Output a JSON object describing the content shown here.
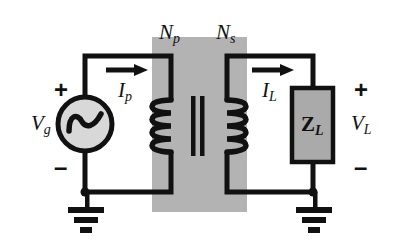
{
  "figure": {
    "kind": "transformer-circuit-schematic",
    "background_color": "#ffffff",
    "line_color": "#111111",
    "core_fill_color": "#b3b3b3",
    "load_fill_color": "#aaaaaa",
    "source_fill_color": "#d8d8d8"
  },
  "labels": {
    "primary_turns": "N",
    "primary_turns_sub": "p",
    "secondary_turns": "N",
    "secondary_turns_sub": "s",
    "primary_current": "I",
    "primary_current_sub": "p",
    "load_current": "I",
    "load_current_sub": "L",
    "source_voltage": "V",
    "source_voltage_sub": "g",
    "load_voltage": "V",
    "load_voltage_sub": "L",
    "load_impedance": "Z",
    "load_impedance_sub": "L",
    "source_plus": "+",
    "source_minus": "–",
    "load_plus": "+",
    "load_minus": "–"
  },
  "components": {
    "source": {
      "name": "ac-voltage-source",
      "symbol": "sine-wave-in-circle",
      "center_x": 85,
      "center_y": 124,
      "radius": 27
    },
    "load": {
      "name": "load-impedance-block",
      "x": 292,
      "y": 88,
      "width": 41,
      "height": 74
    },
    "core": {
      "name": "transformer-core-region",
      "x": 152,
      "y": 37,
      "width": 95,
      "height": 175
    },
    "primary_coil": {
      "name": "primary-winding",
      "turns_drawn": 4,
      "x": 171,
      "bulge": "left"
    },
    "secondary_coil": {
      "name": "secondary-winding",
      "turns_drawn": 4,
      "x": 227,
      "bulge": "right"
    },
    "core_bars": {
      "name": "core-laminations",
      "count": 2,
      "x1": 193,
      "x2": 202,
      "top": 96,
      "bottom": 155
    },
    "ground_left": {
      "name": "ground-symbol-primary",
      "x": 85,
      "y": 192
    },
    "ground_right": {
      "name": "ground-symbol-secondary",
      "x": 313,
      "y": 192
    }
  },
  "arrows": {
    "primary_current_arrow": {
      "x1": 106,
      "x2": 147,
      "y": 70
    },
    "load_current_arrow": {
      "x1": 252,
      "x2": 293,
      "y": 70
    }
  }
}
